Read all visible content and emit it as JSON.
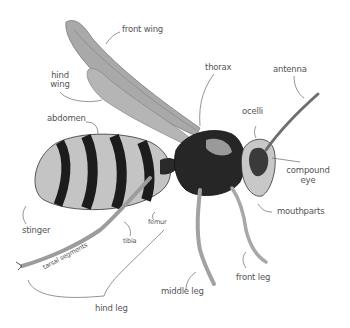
{
  "diagram": {
    "colors": {
      "background": "#ffffff",
      "label_text": "#555555",
      "leader_line": "#666666",
      "body_dark": "#1c1c1c",
      "body_light": "#bdbdbd",
      "wing": "#9a9a9a"
    },
    "labels": {
      "front_wing": "front wing",
      "hind_wing_1": "hind",
      "hind_wing_2": "wing",
      "abdomen": "abdomen",
      "thorax": "thorax",
      "antenna": "antenna",
      "ocelli": "ocelli",
      "compound_eye_1": "compound",
      "compound_eye_2": "eye",
      "mouthparts": "mouthparts",
      "stinger": "stinger",
      "femur": "femur",
      "tibia": "tibia",
      "tarsal_segments": "tarsal segments",
      "hind_leg": "hind leg",
      "middle_leg": "middle leg",
      "front_leg": "front leg"
    }
  }
}
